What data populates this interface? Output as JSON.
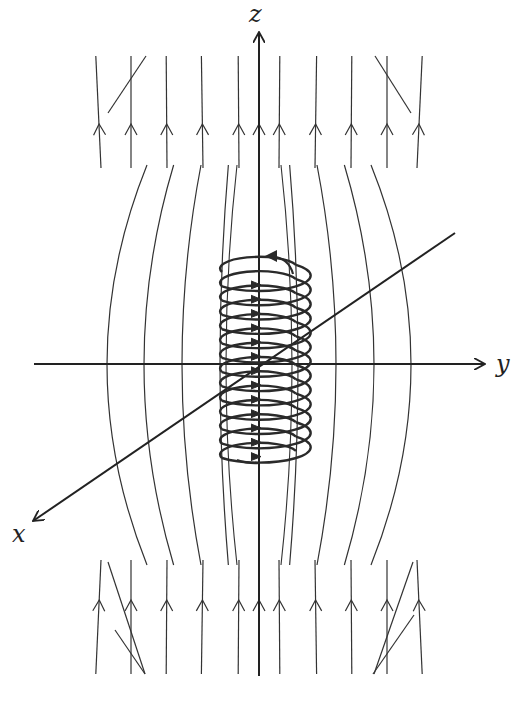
{
  "diagram": {
    "axes": {
      "z": {
        "label": "z",
        "from": [
          259,
          676
        ],
        "to": [
          259,
          32
        ],
        "label_pos": [
          249,
          2
        ]
      },
      "y": {
        "label": "y",
        "from": [
          34,
          364
        ],
        "to": [
          485,
          364
        ],
        "label_pos": [
          496,
          352
        ]
      },
      "x": {
        "label": "x",
        "from": [
          455,
          233
        ],
        "to": [
          33,
          521
        ],
        "label_pos": [
          12,
          522
        ]
      }
    },
    "solenoid": {
      "center_x": 259,
      "top_y": 272,
      "bottom_y": 458,
      "turns": 13,
      "radius_x": 37,
      "radius_y": 11,
      "current_direction": "counterclockwise-viewed-from-top"
    },
    "field_lines": {
      "direction": "up",
      "count_per_side": 6,
      "arrow_rows_y": [
        128,
        600
      ]
    },
    "colors": {
      "line": "#333333",
      "axis": "#222222",
      "coil": "#2a2a2a",
      "background": "#ffffff"
    }
  }
}
